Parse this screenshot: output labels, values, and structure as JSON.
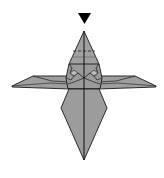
{
  "diagram": {
    "type": "origami-step",
    "colors": {
      "paper": "#9a9a9a",
      "paper_light": "#a8a8a8",
      "line": "#1a1a1a",
      "background": "#ffffff",
      "arrow": "#000000"
    },
    "symbols": [
      {
        "name": "push-arrow",
        "shape": "filled-triangle-down",
        "position": "above top point"
      },
      {
        "name": "valley-fold-line",
        "style": "dashed",
        "position": "upper cone"
      }
    ]
  }
}
